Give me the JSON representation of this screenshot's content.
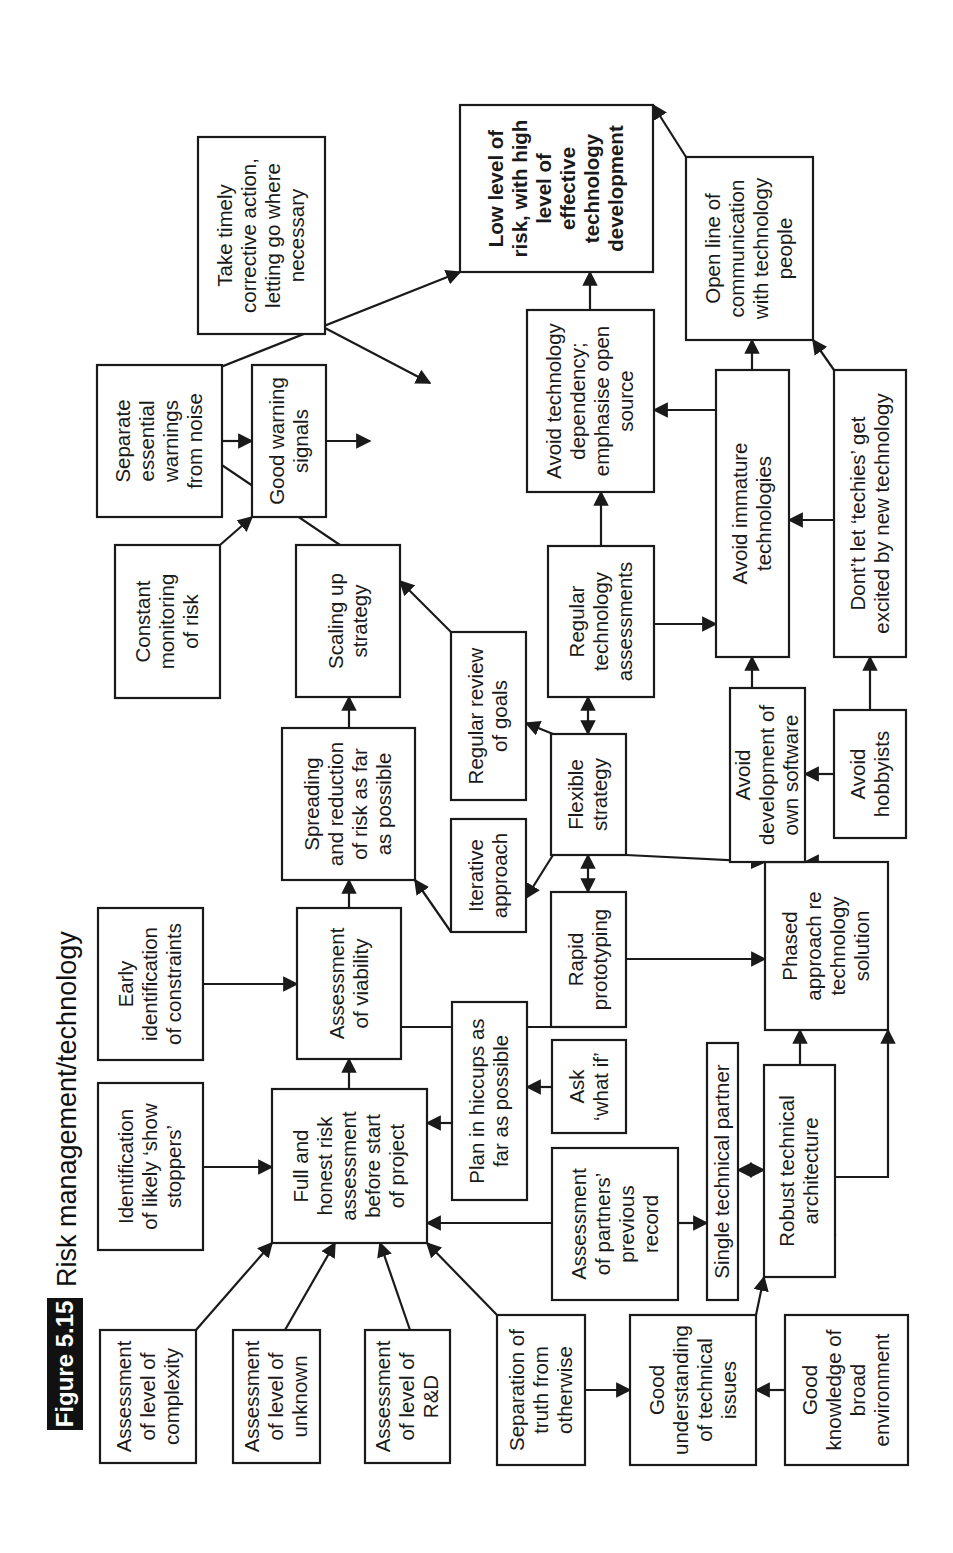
{
  "figure": {
    "number": "Figure 5.15",
    "title": "Risk management/technology"
  },
  "colors": {
    "ink": "#1a1a1a",
    "paper": "#ffffff",
    "badge": "#111111"
  },
  "nodes": [
    {
      "id": "complexity",
      "lines": [
        "Assessment",
        "of level of",
        "complexity"
      ],
      "rect": [
        90,
        100,
        133,
        96
      ]
    },
    {
      "id": "show-stoppers",
      "lines": [
        "Identification",
        "of likely ‘show",
        "stoppers’"
      ],
      "rect": [
        303,
        98,
        167,
        105
      ]
    },
    {
      "id": "constraints",
      "lines": [
        "Early",
        "identification",
        "of constraints"
      ],
      "rect": [
        493,
        98,
        152,
        105
      ]
    },
    {
      "id": "unknown",
      "lines": [
        "Assessment",
        "of level of",
        "unknown"
      ],
      "rect": [
        90,
        233,
        133,
        87
      ]
    },
    {
      "id": "risk-assessment",
      "lines": [
        "Full and",
        "honest risk",
        "assessment",
        "before start",
        "of project"
      ],
      "rect": [
        310,
        272,
        154,
        155
      ]
    },
    {
      "id": "viability",
      "lines": [
        "Assessment",
        "of viability"
      ],
      "rect": [
        494,
        297,
        151,
        104
      ]
    },
    {
      "id": "spreading",
      "lines": [
        "Spreading",
        "and reduction",
        "of risk as far",
        "as possible"
      ],
      "rect": [
        673,
        282,
        152,
        133
      ]
    },
    {
      "id": "scaling",
      "lines": [
        "Scaling up",
        "strategy"
      ],
      "rect": [
        856,
        296,
        152,
        104
      ]
    },
    {
      "id": "monitoring",
      "lines": [
        "Constant",
        "monitoring",
        "of risk"
      ],
      "rect": [
        855,
        115,
        153,
        105
      ]
    },
    {
      "id": "separate-warnings",
      "lines": [
        "Separate",
        "essential",
        "warnings",
        "from noise"
      ],
      "rect": [
        1036,
        97,
        152,
        125
      ]
    },
    {
      "id": "warning-signals",
      "lines": [
        "Good warning",
        "signals"
      ],
      "rect": [
        1036,
        252,
        152,
        74
      ]
    },
    {
      "id": "corrective",
      "lines": [
        "Take timely",
        "corrective action,",
        "letting go where",
        "necessary"
      ],
      "rect": [
        1219,
        198,
        197,
        127
      ]
    },
    {
      "id": "goal",
      "lines": [
        "Low level of",
        "risk, with high",
        "level of",
        "effective",
        "technology",
        "development"
      ],
      "rect": [
        1281,
        460,
        167,
        193
      ],
      "bold": true
    },
    {
      "id": "rnd",
      "lines": [
        "Assessment",
        "of level of",
        "R&D"
      ],
      "rect": [
        90,
        365,
        133,
        85
      ]
    },
    {
      "id": "truth",
      "lines": [
        "Separation of",
        "truth from",
        "otherwise"
      ],
      "rect": [
        88,
        497,
        150,
        88
      ]
    },
    {
      "id": "hiccups",
      "lines": [
        "Plan in hiccups as",
        "far as possible"
      ],
      "rect": [
        353,
        452,
        198,
        75
      ]
    },
    {
      "id": "what-if",
      "lines": [
        "Ask",
        "‘what if’"
      ],
      "rect": [
        420,
        552,
        93,
        74
      ]
    },
    {
      "id": "partners-record",
      "lines": [
        "Assessment",
        "of partners’",
        "previous",
        "record"
      ],
      "rect": [
        253,
        552,
        152,
        126
      ]
    },
    {
      "id": "single-partner",
      "lines": [
        "Single technical partner"
      ],
      "rect": [
        253,
        707,
        257,
        31
      ]
    },
    {
      "id": "robust-arch",
      "lines": [
        "Robust technical",
        "architecture"
      ],
      "rect": [
        276,
        764,
        212,
        71
      ]
    },
    {
      "id": "understanding",
      "lines": [
        "Good",
        "understanding",
        "of technical",
        "issues"
      ],
      "rect": [
        88,
        630,
        150,
        126
      ]
    },
    {
      "id": "environment",
      "lines": [
        "Good",
        "knowledge of",
        "broad",
        "environment"
      ],
      "rect": [
        88,
        785,
        150,
        123
      ]
    },
    {
      "id": "rapid-proto",
      "lines": [
        "Rapid",
        "prototyping"
      ],
      "rect": [
        526,
        551,
        135,
        75
      ]
    },
    {
      "id": "iterative",
      "lines": [
        "Iterative",
        "approach"
      ],
      "rect": [
        621,
        451,
        113,
        75
      ]
    },
    {
      "id": "review-goals",
      "lines": [
        "Regular review",
        "of goals"
      ],
      "rect": [
        753,
        451,
        168,
        75
      ]
    },
    {
      "id": "flexible",
      "lines": [
        "Flexible",
        "strategy"
      ],
      "rect": [
        698,
        551,
        121,
        75
      ]
    },
    {
      "id": "phased",
      "lines": [
        "Phased",
        "approach re",
        "technology",
        "solution"
      ],
      "rect": [
        523,
        765,
        168,
        123
      ]
    },
    {
      "id": "tech-assess",
      "lines": [
        "Regular",
        "technology",
        "assessments"
      ],
      "rect": [
        856,
        548,
        151,
        106
      ]
    },
    {
      "id": "own-software",
      "lines": [
        "Avoid",
        "development of",
        "own software"
      ],
      "rect": [
        691,
        730,
        174,
        75
      ]
    },
    {
      "id": "hobbyists",
      "lines": [
        "Avoid",
        "hobbyists"
      ],
      "rect": [
        715,
        834,
        128,
        72
      ]
    },
    {
      "id": "immature",
      "lines": [
        "Avoid immature",
        "technologies"
      ],
      "rect": [
        896,
        716,
        287,
        73
      ]
    },
    {
      "id": "techies",
      "lines": [
        "Dont’t let ‘techies’ get",
        "excited by new technology"
      ],
      "rect": [
        896,
        834,
        287,
        72
      ]
    },
    {
      "id": "dependency",
      "lines": [
        "Avoid technology",
        "dependency;",
        "emphasise open",
        "source"
      ],
      "rect": [
        1061,
        527,
        182,
        127
      ]
    },
    {
      "id": "open-line",
      "lines": [
        "Open line of",
        "communication",
        "with technology",
        "people"
      ],
      "rect": [
        1213,
        686,
        183,
        127
      ]
    }
  ],
  "edges": [
    {
      "from": "complexity",
      "to": "risk-assessment",
      "points": [
        [
          223,
          196
        ],
        [
          310,
          272
        ]
      ]
    },
    {
      "from": "show-stoppers",
      "to": "risk-assessment",
      "points": [
        [
          386,
          203
        ],
        [
          386,
          272
        ]
      ]
    },
    {
      "from": "constraints",
      "to": "viability",
      "points": [
        [
          569,
          203
        ],
        [
          569,
          297
        ]
      ]
    },
    {
      "from": "unknown",
      "to": "risk-assessment",
      "points": [
        [
          223,
          285
        ],
        [
          310,
          335
        ]
      ]
    },
    {
      "from": "rnd",
      "to": "risk-assessment",
      "points": [
        [
          223,
          410
        ],
        [
          310,
          380
        ]
      ]
    },
    {
      "from": "truth",
      "to": "risk-assessment",
      "points": [
        [
          238,
          497
        ],
        [
          310,
          427
        ]
      ]
    },
    {
      "from": "risk-assessment",
      "to": "viability",
      "points": [
        [
          464,
          349
        ],
        [
          494,
          349
        ]
      ]
    },
    {
      "from": "hiccups",
      "to": "risk-assessment",
      "points": [
        [
          430,
          452
        ],
        [
          430,
          427
        ]
      ]
    },
    {
      "from": "what-if",
      "to": "hiccups",
      "points": [
        [
          466,
          552
        ],
        [
          466,
          527
        ]
      ]
    },
    {
      "from": "partners-record",
      "to": "risk-assessment",
      "points": [
        [
          330,
          552
        ],
        [
          330,
          427
        ]
      ]
    },
    {
      "from": "partners-record",
      "to": "single-partner",
      "points": [
        [
          330,
          678
        ],
        [
          330,
          707
        ]
      ]
    },
    {
      "from": "single-partner",
      "to": "robust-arch",
      "points": [
        [
          383,
          738
        ],
        [
          383,
          764
        ]
      ],
      "bidirectional": true
    },
    {
      "from": "truth",
      "to": "understanding",
      "points": [
        [
          163,
          585
        ],
        [
          163,
          630
        ]
      ]
    },
    {
      "from": "environment",
      "to": "understanding",
      "points": [
        [
          163,
          785
        ],
        [
          163,
          756
        ]
      ]
    },
    {
      "from": "understanding",
      "to": "robust-arch",
      "points": [
        [
          238,
          756
        ],
        [
          276,
          764
        ]
      ]
    },
    {
      "from": "environment",
      "to": "robust-arch",
      "points": [
        [
          318,
          785
        ],
        [
          318,
          835
        ]
      ]
    },
    {
      "from": "environment",
      "to": "phased",
      "points": [
        [
          376,
          785
        ],
        [
          376,
          888
        ],
        [
          523,
          888
        ]
      ],
      "raw": true
    },
    {
      "from": "robust-arch",
      "to": "phased",
      "points": [
        [
          488,
          800
        ],
        [
          523,
          800
        ]
      ]
    },
    {
      "from": "rapid-proto",
      "to": "viability",
      "points": [
        [
          526,
          588
        ],
        [
          526,
          349
        ],
        [
          645,
          349
        ]
      ],
      "raw": true
    },
    {
      "from": "rapid-proto",
      "to": "phased",
      "points": [
        [
          594,
          626
        ],
        [
          594,
          765
        ]
      ]
    },
    {
      "from": "flexible",
      "to": "rapid-proto",
      "points": [
        [
          661,
          588
        ],
        [
          698,
          588
        ]
      ],
      "bidirectional": true
    },
    {
      "from": "flexible",
      "to": "phased",
      "points": [
        [
          698,
          626
        ],
        [
          691,
          765
        ]
      ]
    },
    {
      "from": "flexible",
      "to": "iterative",
      "points": [
        [
          698,
          553
        ],
        [
          655,
          526
        ]
      ]
    },
    {
      "from": "flexible",
      "to": "review-goals",
      "points": [
        [
          819,
          553
        ],
        [
          830,
          526
        ]
      ]
    },
    {
      "from": "flexible",
      "to": "tech-assess",
      "points": [
        [
          819,
          588
        ],
        [
          856,
          588
        ]
      ],
      "bidirectional": true
    },
    {
      "from": "iterative",
      "to": "spreading",
      "points": [
        [
          621,
          451
        ],
        [
          673,
          415
        ]
      ]
    },
    {
      "from": "review-goals",
      "to": "scaling",
      "points": [
        [
          921,
          451
        ],
        [
          972,
          400
        ]
      ]
    },
    {
      "from": "viability",
      "to": "spreading",
      "points": [
        [
          645,
          349
        ],
        [
          673,
          349
        ]
      ]
    },
    {
      "from": "spreading",
      "to": "scaling",
      "points": [
        [
          825,
          349
        ],
        [
          856,
          349
        ]
      ]
    },
    {
      "from": "scaling",
      "to": "goal",
      "points": [
        [
          1008,
          340
        ],
        [
          1150,
          130
        ],
        [
          1281,
          460
        ]
      ],
      "raw": true
    },
    {
      "from": "monitoring",
      "to": "warning-signals",
      "points": [
        [
          1008,
          220
        ],
        [
          1036,
          252
        ]
      ]
    },
    {
      "from": "separate-warnings",
      "to": "warning-signals",
      "points": [
        [
          1112,
          222
        ],
        [
          1112,
          252
        ]
      ]
    },
    {
      "from": "warning-signals",
      "to": "goal",
      "points": [
        [
          1112,
          326
        ],
        [
          1112,
          370
        ]
      ]
    },
    {
      "from": "corrective",
      "to": "goal",
      "points": [
        [
          1225,
          325
        ],
        [
          1170,
          430
        ]
      ]
    },
    {
      "from": "phased",
      "to": "own-software",
      "points": [
        [
          691,
          820
        ],
        [
          691,
          805
        ]
      ]
    },
    {
      "from": "hobbyists",
      "to": "own-software",
      "points": [
        [
          779,
          834
        ],
        [
          779,
          805
        ]
      ]
    },
    {
      "from": "own-software",
      "to": "immature",
      "points": [
        [
          865,
          752
        ],
        [
          896,
          752
        ]
      ]
    },
    {
      "from": "techies",
      "to": "hobbyists",
      "points": [
        [
          843,
          870
        ],
        [
          843,
          870
        ]
      ],
      "hidden": true
    },
    {
      "from": "hobbyists",
      "to": "techies",
      "points": [
        [
          843,
          870
        ],
        [
          896,
          870
        ]
      ]
    },
    {
      "from": "tech-assess",
      "to": "dependency",
      "points": [
        [
          1007,
          601
        ],
        [
          1061,
          601
        ]
      ]
    },
    {
      "from": "tech-assess",
      "to": "immature",
      "points": [
        [
          929,
          654
        ],
        [
          929,
          716
        ]
      ]
    },
    {
      "from": "techies",
      "to": "immature",
      "points": [
        [
          1033,
          834
        ],
        [
          1033,
          789
        ]
      ]
    },
    {
      "from": "immature",
      "to": "dependency",
      "points": [
        [
          1143,
          716
        ],
        [
          1143,
          654
        ]
      ]
    },
    {
      "from": "immature",
      "to": "open-line",
      "points": [
        [
          1183,
          752
        ],
        [
          1213,
          752
        ]
      ],
      "raw": true
    },
    {
      "from": "techies",
      "to": "open-line",
      "points": [
        [
          1183,
          834
        ],
        [
          1213,
          813
        ]
      ]
    },
    {
      "from": "dependency",
      "to": "goal",
      "points": [
        [
          1243,
          590
        ],
        [
          1281,
          590
        ]
      ]
    },
    {
      "from": "open-line",
      "to": "goal",
      "points": [
        [
          1396,
          686
        ],
        [
          1448,
          653
        ]
      ],
      "raw": true
    }
  ]
}
